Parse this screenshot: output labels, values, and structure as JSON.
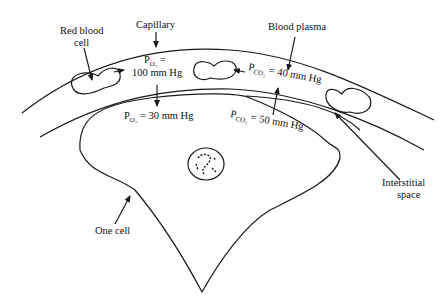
{
  "diagram": {
    "labels": {
      "capillary": "Capillary",
      "red_blood_cell_line1": "Red blood",
      "red_blood_cell_line2": "cell",
      "blood_plasma": "Blood plasma",
      "interstitial_line1": "Interstitial",
      "interstitial_line2": "space",
      "one_cell": "One cell"
    },
    "values": {
      "po2_capillary_p": "P",
      "po2_capillary_sub": "O₂",
      "po2_capillary_eq": " =",
      "po2_capillary_val": "100 mm Hg",
      "po2_cell_p": "P",
      "po2_cell_sub": "O₂",
      "po2_cell_val": " = 30 mm Hg",
      "pco2_capillary_p": "P",
      "pco2_capillary_sub": "CO₂",
      "pco2_capillary_val": " = 40 mm Hg",
      "pco2_cell_p": "P",
      "pco2_cell_sub": "CO₂",
      "pco2_cell_val": " = 50 mm Hg"
    }
  }
}
